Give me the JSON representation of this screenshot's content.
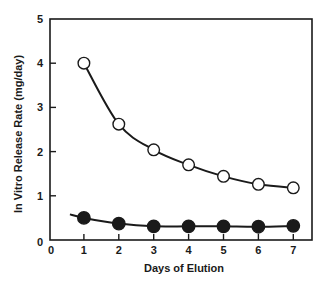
{
  "chart_data": {
    "type": "line",
    "title": "",
    "xlabel": "Days of Elution",
    "ylabel": "In Vitro Release Rate (mg/day)",
    "xlim": [
      0,
      7.6
    ],
    "ylim": [
      0,
      5
    ],
    "x_ticks": [
      0,
      1,
      2,
      3,
      4,
      5,
      6,
      7
    ],
    "y_ticks": [
      0,
      1,
      2,
      3,
      4,
      5
    ],
    "grid": false,
    "legend": null,
    "x": [
      1,
      2,
      3,
      4,
      5,
      6,
      7
    ],
    "series": [
      {
        "name": "open-circles",
        "marker": "open-circle",
        "values": [
          4.0,
          2.62,
          2.04,
          1.7,
          1.44,
          1.26,
          1.18
        ],
        "curve_start": null
      },
      {
        "name": "filled-circles",
        "marker": "filled-circle",
        "values": [
          0.5,
          0.37,
          0.31,
          0.31,
          0.31,
          0.3,
          0.32
        ],
        "curve_start": [
          0.6,
          0.58
        ]
      }
    ]
  },
  "colors": {
    "ink": "#1a1a1a",
    "background": "#ffffff"
  }
}
